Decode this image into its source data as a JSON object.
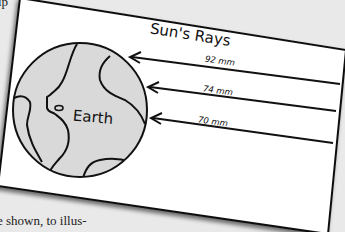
{
  "page": {
    "fragment_top": "ip",
    "fragment_bottom": "e shown, to illus-"
  },
  "diagram": {
    "title": "Sun's Rays",
    "planet_label": "Earth",
    "rays": [
      {
        "label": "92 mm"
      },
      {
        "label": "74 mm"
      },
      {
        "label": "70 mm"
      }
    ],
    "colors": {
      "card": "#ffffff",
      "land": "#d9d9d9",
      "outline": "#111111",
      "background": "#e9e9e9"
    }
  }
}
